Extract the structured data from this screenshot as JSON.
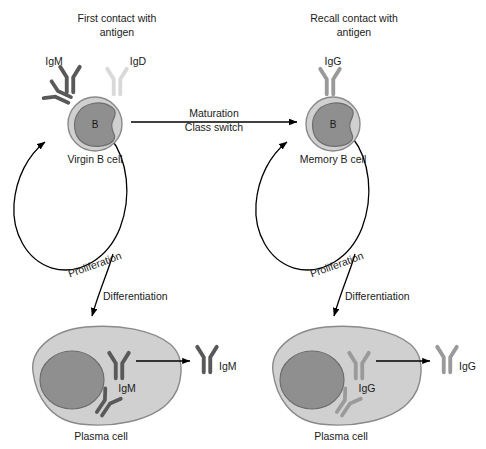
{
  "diagram": {
    "title_left": "First contact with antigen",
    "title_left_line1": "First contact with",
    "title_left_line2": "antigen",
    "title_right_line1": "Recall contact with",
    "title_right_line2": "antigen",
    "colors": {
      "cytoplasm": "#d0d0d0",
      "cytoplasm_stroke": "#8a8a8a",
      "nucleus": "#8f8f8f",
      "nucleus_stroke": "#6e6e6e",
      "igm_dark": "#595959",
      "igg_mid": "#9a9a9a",
      "igd_light": "#d9d9d9",
      "arrow": "#000000",
      "text": "#1a1a1a"
    },
    "left_branch": {
      "cell_letter": "B",
      "cell_label": "Virgin B cell",
      "receptor_left_label": "IgM",
      "receptor_right_label": "IgD",
      "proliferation_label": "Proliferation",
      "differentiation_label": "Differentiation",
      "plasma_label": "Plasma cell",
      "plasma_ig_label": "IgM",
      "secreted_ig_label": "IgM"
    },
    "right_branch": {
      "cell_letter": "B",
      "cell_label": "Memory B cell",
      "receptor_label": "IgG",
      "proliferation_label": "Proliferation",
      "differentiation_label": "Differentiation",
      "plasma_label": "Plasma cell",
      "plasma_ig_label": "IgG",
      "secreted_ig_label": "IgG"
    },
    "center_arrow": {
      "line1": "Maturation",
      "line2": "Class switch"
    }
  }
}
